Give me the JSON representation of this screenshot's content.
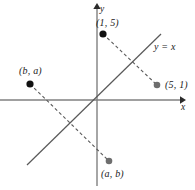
{
  "figure": {
    "kind": "coordinate-plane-reflection-diagram",
    "axes": {
      "x_label": "x",
      "y_label": "y",
      "origin": [
        97,
        100
      ],
      "x_axis_from": [
        0,
        100
      ],
      "x_axis_to": [
        183,
        100
      ],
      "y_axis_from": [
        97,
        185
      ],
      "y_axis_to": [
        97,
        5
      ],
      "color": "#808080"
    },
    "identity_line": {
      "label": "y = x",
      "from": [
        27,
        165
      ],
      "to": [
        161,
        34
      ],
      "color": "#595959",
      "style": "solid"
    },
    "dashed_segments": [
      {
        "name": "segment-1-5-to-5-1",
        "from": [
          103,
          34
        ],
        "to": [
          157,
          85
        ],
        "color": "#595959",
        "style": "dashed"
      },
      {
        "name": "segment-b-a-to-a-b",
        "from": [
          30,
          84
        ],
        "to": [
          109,
          161
        ],
        "color": "#595959",
        "style": "dashed"
      }
    ],
    "points": [
      {
        "name": "point-1-5",
        "label": "(1, 5)",
        "cx": 103,
        "cy": 34,
        "r": 3.4,
        "color": "#111111"
      },
      {
        "name": "point-5-1",
        "label": "(5, 1)",
        "cx": 157,
        "cy": 85,
        "r": 3.2,
        "color": "#6e6e6e"
      },
      {
        "name": "point-b-a",
        "label": "(b, a)",
        "cx": 30,
        "cy": 84,
        "r": 3.4,
        "color": "#111111"
      },
      {
        "name": "point-a-b",
        "label": "(a, b)",
        "cx": 109,
        "cy": 161,
        "r": 3.2,
        "color": "#6e6e6e"
      }
    ]
  }
}
